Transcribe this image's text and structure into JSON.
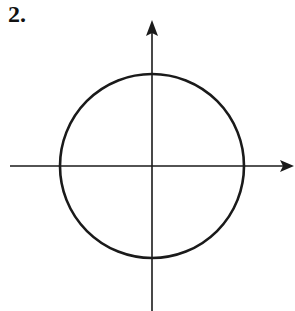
{
  "problem": {
    "number_label": "2."
  },
  "figure": {
    "type": "circle-on-axes",
    "stroke_color": "#1a1a1a",
    "center": [
      152,
      166
    ],
    "radius": 92,
    "x_axis": {
      "from": [
        10,
        166
      ],
      "to": [
        294,
        166
      ],
      "arrow": "right"
    },
    "y_axis": {
      "from": [
        152,
        311
      ],
      "to": [
        152,
        20
      ],
      "arrow": "up"
    }
  }
}
